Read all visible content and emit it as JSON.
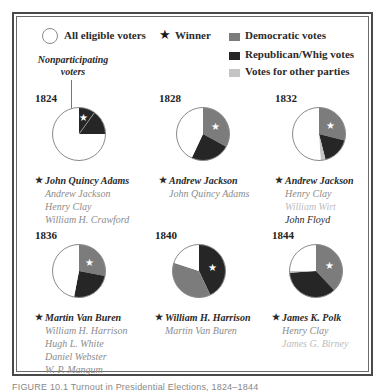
{
  "colors": {
    "democratic": "#7c7c7c",
    "republican_whig": "#262626",
    "other": "#c4c4c4",
    "nonparticipating": "#ffffff",
    "outline": "#8a8a8a",
    "winner_text": "#2a2a2a",
    "loser_text": "#8c8c8c",
    "minor_text": "#bdbdbd"
  },
  "legend": {
    "all_eligible": "All eligible voters",
    "winner": "Winner",
    "democratic": "Democratic votes",
    "republican_whig": "Republican/Whig votes",
    "other": "Votes for other parties",
    "nonparticipating": "Nonparticipating voters",
    "star_glyph": "★"
  },
  "caption": "FIGURE 10.1 Turnout in Presidential Elections, 1824–1844",
  "chart_data": {
    "type": "pie",
    "title": "Turnout in Presidential Elections, 1824–1844",
    "legend_position": "top",
    "series_labels": [
      "Democratic votes",
      "Republican/Whig votes",
      "Votes for other parties",
      "Nonparticipating voters"
    ],
    "elections": [
      {
        "year": "1824",
        "slices": {
          "democratic": 0,
          "republican_whig": 25,
          "other": 0,
          "nonparticipating": 75
        },
        "winner_slice": "republican_whig",
        "candidates": [
          {
            "name": "John Quincy Adams",
            "winner": true,
            "tone": "winner"
          },
          {
            "name": "Andrew Jackson",
            "winner": false,
            "tone": "loser"
          },
          {
            "name": "Henry Clay",
            "winner": false,
            "tone": "loser"
          },
          {
            "name": "William H. Crawford",
            "winner": false,
            "tone": "loser"
          }
        ]
      },
      {
        "year": "1828",
        "slices": {
          "democratic": 33,
          "republican_whig": 24,
          "other": 0,
          "nonparticipating": 43
        },
        "winner_slice": "democratic",
        "candidates": [
          {
            "name": "Andrew Jackson",
            "winner": true,
            "tone": "winner"
          },
          {
            "name": "John Quincy Adams",
            "winner": false,
            "tone": "loser"
          }
        ]
      },
      {
        "year": "1832",
        "slices": {
          "democratic": 29,
          "republican_whig": 17,
          "other": 3,
          "nonparticipating": 51
        },
        "winner_slice": "democratic",
        "candidates": [
          {
            "name": "Andrew Jackson",
            "winner": true,
            "tone": "winner"
          },
          {
            "name": "Henry Clay",
            "winner": false,
            "tone": "loser"
          },
          {
            "name": "William Wirt",
            "winner": false,
            "tone": "minor"
          },
          {
            "name": "John Floyd",
            "winner": false,
            "tone": "winner"
          }
        ]
      },
      {
        "year": "1836",
        "slices": {
          "democratic": 28,
          "republican_whig": 25,
          "other": 0,
          "nonparticipating": 47
        },
        "winner_slice": "democratic",
        "candidates": [
          {
            "name": "Martin Van Buren",
            "winner": true,
            "tone": "winner"
          },
          {
            "name": "William H. Harrison",
            "winner": false,
            "tone": "loser"
          },
          {
            "name": "Hugh L. White",
            "winner": false,
            "tone": "loser"
          },
          {
            "name": "Daniel Webster",
            "winner": false,
            "tone": "loser"
          },
          {
            "name": "W. P. Mangum",
            "winner": false,
            "tone": "loser"
          }
        ]
      },
      {
        "year": "1840",
        "slices": {
          "democratic": 37,
          "republican_whig": 43,
          "other": 0,
          "nonparticipating": 20
        },
        "winner_slice": "republican_whig",
        "candidates": [
          {
            "name": "William H. Harrison",
            "winner": true,
            "tone": "winner"
          },
          {
            "name": "Martin Van Buren",
            "winner": false,
            "tone": "loser"
          }
        ]
      },
      {
        "year": "1844",
        "slices": {
          "democratic": 38,
          "republican_whig": 36,
          "other": 1,
          "nonparticipating": 25
        },
        "winner_slice": "democratic",
        "candidates": [
          {
            "name": "James K. Polk",
            "winner": true,
            "tone": "winner"
          },
          {
            "name": "Henry Clay",
            "winner": false,
            "tone": "loser"
          },
          {
            "name": "James G. Birney",
            "winner": false,
            "tone": "minor"
          }
        ]
      }
    ]
  }
}
